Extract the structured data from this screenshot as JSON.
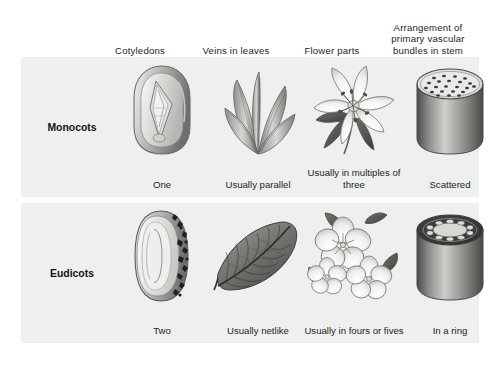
{
  "figure": {
    "panel_bg": "#eeefef",
    "text_color": "#1e1e1e"
  },
  "columns": [
    {
      "id": "cotyledons",
      "label": "Cotyledons"
    },
    {
      "id": "veins-in-leaves",
      "label": "Veins in leaves"
    },
    {
      "id": "flower-parts",
      "label": "Flower parts"
    },
    {
      "id": "vascular-bundles",
      "label": "Arrangement of primary vascular bundles in stem"
    }
  ],
  "rows": [
    {
      "id": "monocots",
      "label": "Monocots",
      "cells": [
        {
          "id": "monocot-cotyledons",
          "caption": "One",
          "icon": "corn-kernel-seed-icon"
        },
        {
          "id": "monocot-veins",
          "caption": "Usually parallel",
          "icon": "parallel-veined-leaves-icon"
        },
        {
          "id": "monocot-flower",
          "caption": "Usually in multiples of three",
          "icon": "lily-flower-icon"
        },
        {
          "id": "monocot-stem",
          "caption": "Scattered",
          "icon": "scattered-bundles-stem-icon"
        }
      ]
    },
    {
      "id": "eudicots",
      "label": "Eudicots",
      "cells": [
        {
          "id": "eudicot-cotyledons",
          "caption": "Two",
          "icon": "bean-seed-icon"
        },
        {
          "id": "eudicot-veins",
          "caption": "Usually netlike",
          "icon": "netlike-veined-leaf-icon"
        },
        {
          "id": "eudicot-flower",
          "caption": "Usually in fours or fives",
          "icon": "five-petal-flowers-icon"
        },
        {
          "id": "eudicot-stem",
          "caption": "In a ring",
          "icon": "ring-bundles-stem-icon"
        }
      ]
    }
  ]
}
